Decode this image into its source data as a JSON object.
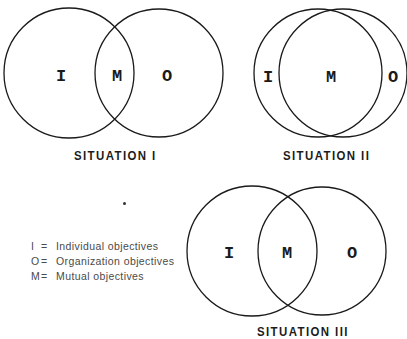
{
  "diagrams": [
    {
      "id": "situation-1",
      "label": "SITUATION I",
      "circles": [
        {
          "name": "individual",
          "cx": 69,
          "cy": 73,
          "r": 65
        },
        {
          "name": "organization",
          "cx": 159,
          "cy": 73,
          "r": 64
        }
      ],
      "letters": [
        {
          "text": "I",
          "x": 61,
          "y": 81
        },
        {
          "text": "M",
          "x": 117,
          "y": 81
        },
        {
          "text": "O",
          "x": 167,
          "y": 81
        }
      ]
    },
    {
      "id": "situation-2",
      "label": "SITUATION II",
      "circles": [
        {
          "name": "individual",
          "cx": 318,
          "cy": 73,
          "r": 64
        },
        {
          "name": "organization",
          "cx": 343,
          "cy": 73,
          "r": 64
        }
      ],
      "letters": [
        {
          "text": "I",
          "x": 268,
          "y": 82
        },
        {
          "text": "M",
          "x": 331,
          "y": 82
        },
        {
          "text": "O",
          "x": 393,
          "y": 82
        }
      ]
    },
    {
      "id": "situation-3",
      "label": "SITUATION III",
      "circles": [
        {
          "name": "individual",
          "cx": 252,
          "cy": 251,
          "r": 65
        },
        {
          "name": "organization",
          "cx": 322,
          "cy": 251,
          "r": 64
        }
      ],
      "letters": [
        {
          "text": "I",
          "x": 229,
          "y": 258
        },
        {
          "text": "M",
          "x": 287,
          "y": 258
        },
        {
          "text": "O",
          "x": 352,
          "y": 258
        }
      ]
    }
  ],
  "labels": {
    "situation_1": "SITUATION I",
    "situation_2": "SITUATION II",
    "situation_3": "SITUATION III"
  },
  "legend": [
    {
      "key": "I",
      "eq": "=",
      "desc": "Individual objectives"
    },
    {
      "key": "O",
      "eq": "=",
      "desc": "Organization objectives"
    },
    {
      "key": "M",
      "eq": "=",
      "desc": "Mutual objectives"
    }
  ],
  "colors": {
    "stroke": "#1a1a1a",
    "label": "#1c1c1c",
    "legend_text": "#4a4a4a",
    "background": "#ffffff"
  }
}
